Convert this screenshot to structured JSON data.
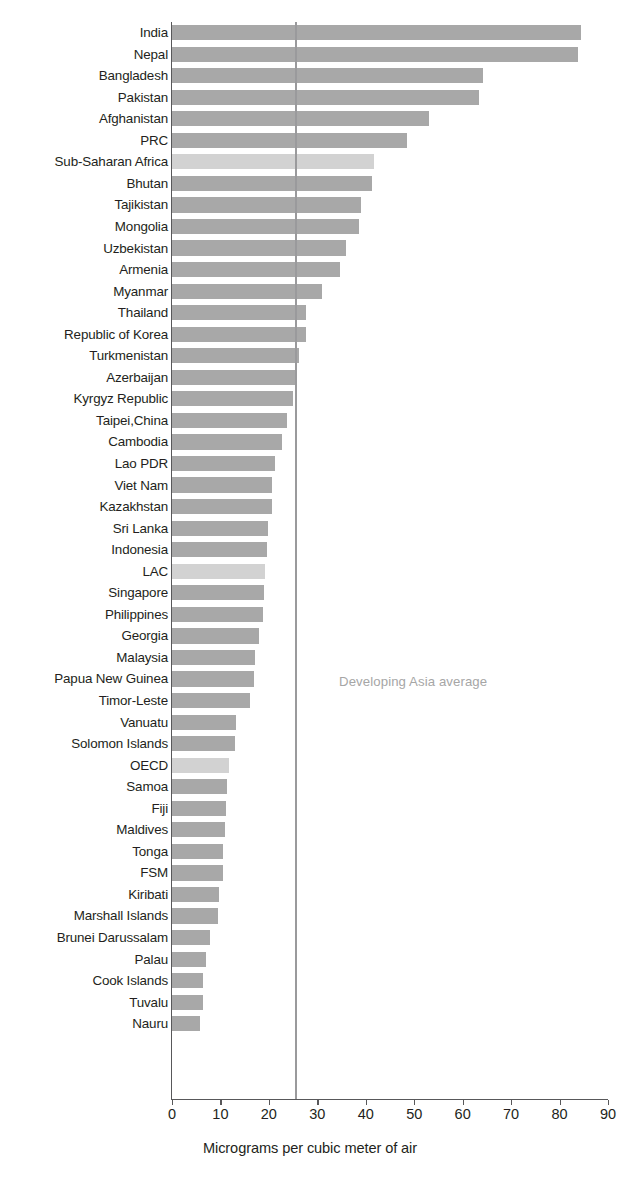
{
  "chart_data": {
    "type": "bar",
    "orientation": "horizontal",
    "title": "",
    "subtitle": "",
    "xlabel": "Micrograms per cubic meter of air",
    "ylabel": "",
    "xlim": [
      0,
      90
    ],
    "xticks": [
      0,
      10,
      20,
      30,
      40,
      50,
      60,
      70,
      80,
      90
    ],
    "xtick_labels": [
      "0",
      "10",
      "20",
      "30",
      "40",
      "50",
      "60",
      "70",
      "80",
      "90"
    ],
    "grid": false,
    "legend": null,
    "series_name": "PM2.5 annual mean concentration",
    "categories": [
      "India",
      "Nepal",
      "Bangladesh",
      "Pakistan",
      "Afghanistan",
      "PRC",
      "Sub-Saharan Africa",
      "Bhutan",
      "Tajikistan",
      "Mongolia",
      "Uzbekistan",
      "Armenia",
      "Myanmar",
      "Thailand",
      "Republic of Korea",
      "Turkmenistan",
      "Azerbaijan",
      "Kyrgyz Republic",
      "Taipei,China",
      "Cambodia",
      "Lao PDR",
      "Viet Nam",
      "Kazakhstan",
      "Sri Lanka",
      "Indonesia",
      "LAC",
      "Singapore",
      "Philippines",
      "Georgia",
      "Malaysia",
      "Papua New Guinea",
      "Timor-Leste",
      "Vanuatu",
      "Solomon Islands",
      "OECD",
      "Samoa",
      "Fiji",
      "Maldives",
      "Tonga",
      "FSM",
      "Kiribati",
      "Marshall Islands",
      "Brunei Darussalam",
      "Palau",
      "Cook Islands",
      "Tuvalu",
      "Nauru"
    ],
    "values": [
      84.4,
      83.8,
      64.3,
      63.4,
      53.0,
      48.6,
      41.6,
      41.2,
      39.1,
      38.6,
      36.0,
      34.6,
      31.0,
      27.6,
      27.7,
      26.3,
      25.8,
      25.0,
      23.8,
      22.7,
      21.2,
      20.7,
      20.6,
      19.8,
      19.6,
      19.3,
      19.0,
      18.8,
      18.0,
      17.1,
      16.9,
      16.2,
      13.2,
      13.1,
      11.8,
      11.3,
      11.2,
      11.0,
      10.6,
      10.6,
      9.6,
      9.5,
      7.8,
      7.0,
      6.4,
      6.3,
      5.8
    ],
    "highlighted": [
      "Sub-Saharan Africa",
      "LAC",
      "OECD"
    ],
    "bar_color": "#a8a8a8",
    "highlight_bar_color": "#d2d2d2",
    "axis_color": "#58585a",
    "annotations": [
      {
        "name": "developing-asia-average",
        "text": "Developing Asia average",
        "value": 25.4,
        "line_color": "#9a9a9c"
      }
    ]
  }
}
